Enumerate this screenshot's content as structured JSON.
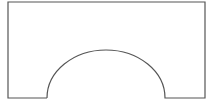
{
  "diagram": {
    "stroke_color": "#555555",
    "background_color": "#ffffff",
    "shape": {
      "outer_left": 8,
      "outer_top": 2,
      "outer_right": 205,
      "outer_bottom": 98,
      "arch_left_x": 47,
      "arch_right_x": 165,
      "arch_apex_y": 50,
      "arch_rx": 59,
      "arch_ry": 48
    }
  }
}
